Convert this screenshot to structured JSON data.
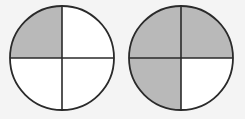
{
  "diagram": {
    "colors": {
      "background": "#f4f4f4",
      "fill_shaded": "#b9b9b9",
      "fill_unshaded": "#ffffff",
      "stroke": "#2a2a2a"
    },
    "circles": [
      {
        "id": "left",
        "cx": 62,
        "cy": 58,
        "r": 52,
        "quarters": {
          "top_left": true,
          "top_right": false,
          "bottom_left": false,
          "bottom_right": false
        },
        "shaded_count": 1,
        "total_parts": 4
      },
      {
        "id": "right",
        "cx": 181,
        "cy": 58,
        "r": 52,
        "quarters": {
          "top_left": true,
          "top_right": true,
          "bottom_left": true,
          "bottom_right": false
        },
        "shaded_count": 3,
        "total_parts": 4
      }
    ]
  }
}
